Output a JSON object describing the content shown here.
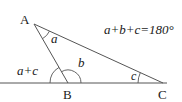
{
  "diagram": {
    "type": "triangle-exterior-angle",
    "vertices": {
      "A": {
        "label": "A",
        "x": 34,
        "y": 24
      },
      "B": {
        "label": "B",
        "x": 68,
        "y": 83
      },
      "C": {
        "label": "C",
        "x": 163,
        "y": 83
      }
    },
    "angle_labels": {
      "a": "a",
      "b": "b",
      "c": "c",
      "exterior": "a+c"
    },
    "equation": "a+b+c=180°",
    "colors": {
      "line": "#555555",
      "text": "#1a1a1a",
      "background": "#ffffff"
    }
  }
}
